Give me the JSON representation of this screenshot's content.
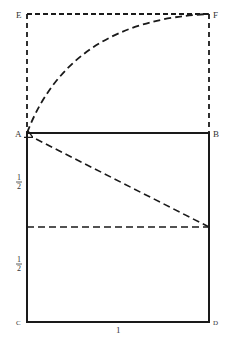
{
  "diagram": {
    "colors": {
      "stroke": "#1a1a1a",
      "label": "#333333",
      "background": "#ffffff"
    },
    "points": {
      "E": {
        "label": "E",
        "x": 27,
        "y": 14
      },
      "F": {
        "label": "F",
        "x": 209,
        "y": 14
      },
      "A": {
        "label": "A",
        "x": 27,
        "y": 133
      },
      "B": {
        "label": "B",
        "x": 209,
        "y": 133
      },
      "C": {
        "label": "C",
        "x": 27,
        "y": 322
      },
      "D": {
        "label": "D",
        "x": 209,
        "y": 322
      }
    },
    "labels": {
      "E": "E",
      "F": "F",
      "A": "A",
      "B": "B",
      "C": "C",
      "D": "D",
      "upper_half_num": "1",
      "upper_half_den": "2",
      "lower_half_num": "1",
      "lower_half_den": "2",
      "bottom_side": "1"
    },
    "midline_y": 227
  }
}
